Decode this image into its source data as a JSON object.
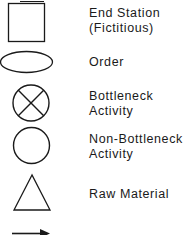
{
  "legend": {
    "items": [
      {
        "symbol": "square-icon",
        "line1": "End Station",
        "line2": "(Fictitious)"
      },
      {
        "symbol": "ellipse-icon",
        "line1": "Order",
        "line2": ""
      },
      {
        "symbol": "circle-x-icon",
        "line1": "Bottleneck",
        "line2": "Activity"
      },
      {
        "symbol": "circle-icon",
        "line1": "Non-Bottleneck",
        "line2": "Activity"
      },
      {
        "symbol": "triangle-icon",
        "line1": "Raw Material",
        "line2": ""
      },
      {
        "symbol": "arrow-right-icon",
        "line1": "Material  Flow",
        "line2": ""
      }
    ],
    "stroke_color": "#1a1a1a",
    "background": "#ffffff"
  }
}
